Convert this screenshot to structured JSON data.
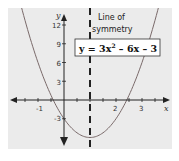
{
  "chart_data": {
    "type": "line",
    "title": "",
    "equation_label": "y = 3x² − 6x − 3",
    "equation_parts": {
      "lhs": "y = 3x",
      "sup": "2",
      "rhs": " – 6x – 3"
    },
    "annotation": {
      "line1": "Line of",
      "line2": "symmetry",
      "x": 1
    },
    "xlabel": "x",
    "ylabel": "y",
    "xlim": [
      -1.9,
      3.9
    ],
    "ylim": [
      -7.5,
      14
    ],
    "x_ticks": [
      -1,
      1,
      2,
      3
    ],
    "x_tick_labels": [
      "-1",
      "2",
      "3"
    ],
    "y_ticks": [
      -3,
      3,
      6,
      9,
      12
    ],
    "y_tick_labels": [
      "-3",
      "3",
      "6",
      "9",
      "12"
    ],
    "series": [
      {
        "name": "y = 3x^2 - 6x - 3",
        "function": "3x^2 - 6x - 3",
        "x": [
          -1.5,
          -1,
          -0.5,
          0,
          0.5,
          1,
          1.5,
          2,
          2.5,
          3,
          3.5
        ],
        "y": [
          15.75,
          6,
          -0.25,
          -3,
          -5.25,
          -6,
          -5.25,
          -3,
          -0.25,
          6,
          15.75
        ]
      }
    ],
    "vertex": [
      1,
      -6
    ],
    "roots": [
      -0.41,
      2.41
    ],
    "grid": false,
    "legend": "none",
    "colors": {
      "background": "#ebebeb",
      "curve": "#7a6a6a",
      "axes": "#222222",
      "symmetry_line": "#222222",
      "label_box_border": "#333333",
      "label_box_fill": "#ffffff"
    }
  }
}
